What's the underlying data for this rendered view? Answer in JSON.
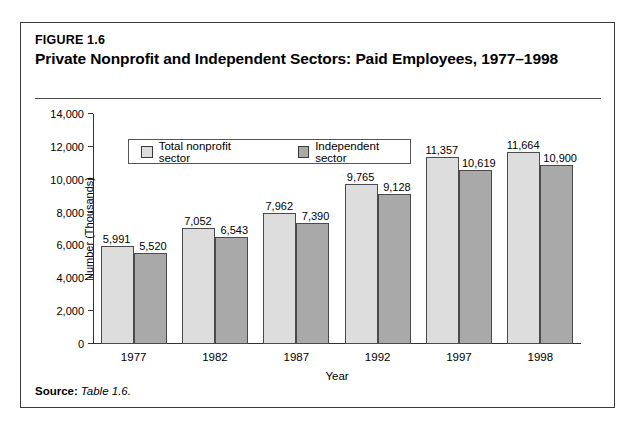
{
  "figure": {
    "number": "FIGURE 1.6",
    "title": "Private Nonprofit and Independent Sectors: Paid Employees, 1977–1998",
    "source_label": "Source:",
    "source_value": "Table 1.6."
  },
  "colors": {
    "total_nonprofit": "#dddddd",
    "independent": "#a9a9a9",
    "border": "#4a4a4a",
    "frame": "#3a3a3a"
  },
  "chart_data": {
    "type": "bar",
    "title": "Private Nonprofit and Independent Sectors: Paid Employees, 1977–1998",
    "xlabel": "Year",
    "ylabel": "Number (Thousands)",
    "categories": [
      "1977",
      "1982",
      "1987",
      "1992",
      "1997",
      "1998"
    ],
    "series": [
      {
        "name": "Total nonprofit sector",
        "color": "#dddddd",
        "values": [
          5991,
          7052,
          7962,
          9765,
          11357,
          11664
        ],
        "labels": [
          "5,991",
          "7,052",
          "7,962",
          "9,765",
          "11,357",
          "11,664"
        ]
      },
      {
        "name": "Independent sector",
        "color": "#a9a9a9",
        "values": [
          5520,
          6543,
          7390,
          9128,
          10619,
          10900
        ],
        "labels": [
          "5,520",
          "6,543",
          "7,390",
          "9,128",
          "10,619",
          "10,900"
        ]
      }
    ],
    "ylim": [
      0,
      14000
    ],
    "yticks": [
      0,
      2000,
      4000,
      6000,
      8000,
      10000,
      12000,
      14000
    ],
    "ytick_labels": [
      "0",
      "2,000",
      "4,000",
      "6,000",
      "8,000",
      "10,000",
      "12,000",
      "14,000"
    ],
    "grid": false,
    "legend_position": "top-left"
  }
}
